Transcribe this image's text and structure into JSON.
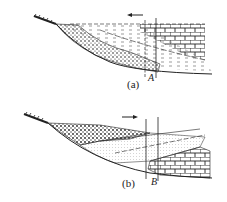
{
  "diagram": {
    "panels": [
      {
        "id": "a",
        "caption": "(a)",
        "well_label": "A",
        "arrow_direction": "left",
        "description": "Regressive sequence: sand/conglomerate wedge over shale, carbonate (brick) facies on right"
      },
      {
        "id": "b",
        "caption": "(b)",
        "well_label": "B",
        "arrow_direction": "right",
        "description": "Transgressive sequence: conglomerate wedge upper-left, carbonate (brick) facies lower-right"
      }
    ],
    "legend_patterns": [
      "hatched-ground",
      "dotted-sandstone",
      "dashed-shale",
      "brick-limestone"
    ],
    "colors": {
      "ink": "#222222",
      "background": "#ffffff"
    }
  }
}
